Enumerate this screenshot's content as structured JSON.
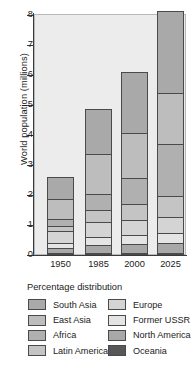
{
  "chart_data": {
    "type": "bar",
    "stacked": true,
    "title": "",
    "subtitle": "",
    "xlabel": "",
    "ylabel": "World population (millions)",
    "categories": [
      "1950",
      "1985",
      "2000",
      "2025"
    ],
    "ylim": [
      0,
      8
    ],
    "yticks": [
      0,
      1,
      2,
      3,
      4,
      5,
      6,
      7,
      8
    ],
    "ytick_labels": [
      "0",
      "1",
      "2",
      "3",
      "4",
      "5",
      "6",
      "7",
      "8"
    ],
    "grid": false,
    "legend_position": "below",
    "legend_title": "Percentage distribution",
    "stack_order_bottom_to_top": [
      "Oceania",
      "North America",
      "Former USSR",
      "Europe",
      "Latin America",
      "Africa",
      "East Asia",
      "South Asia"
    ],
    "series": [
      {
        "name": "Oceania",
        "color": "#575757",
        "values": [
          0.01,
          0.02,
          0.03,
          0.04
        ]
      },
      {
        "name": "North America",
        "color": "#a8a8a8",
        "values": [
          0.17,
          0.26,
          0.31,
          0.33
        ]
      },
      {
        "name": "Former USSR",
        "color": "#e4e4e4",
        "values": [
          0.18,
          0.28,
          0.29,
          0.35
        ]
      },
      {
        "name": "Europe",
        "color": "#d4d4d4",
        "values": [
          0.39,
          0.49,
          0.51,
          0.51
        ]
      },
      {
        "name": "Latin America",
        "color": "#c4c4c4",
        "values": [
          0.17,
          0.4,
          0.52,
          0.7
        ]
      },
      {
        "name": "Africa",
        "color": "#b0b0b0",
        "values": [
          0.22,
          0.55,
          0.87,
          1.76
        ]
      },
      {
        "name": "East Asia",
        "color": "#bdbdbd",
        "values": [
          0.68,
          1.33,
          1.49,
          1.68
        ]
      },
      {
        "name": "South Asia",
        "color": "#a9a9a9",
        "values": [
          0.73,
          1.49,
          2.05,
          2.74
        ]
      }
    ],
    "bar_totals": [
      2.55,
      4.82,
      6.07,
      8.11
    ]
  },
  "axis": {
    "y_title": "World population (millions)",
    "y_ticks": [
      "0",
      "1",
      "2",
      "3",
      "4",
      "5",
      "6",
      "7",
      "8"
    ],
    "x_ticks": [
      "1950",
      "1985",
      "2000",
      "2025"
    ]
  },
  "legend": {
    "title": "Percentage distribution",
    "rows": [
      {
        "left": {
          "label": "South Asia",
          "color": "#a9a9a9"
        },
        "right": {
          "label": "Europe",
          "color": "#d4d4d4"
        }
      },
      {
        "left": {
          "label": "East Asia",
          "color": "#bdbdbd"
        },
        "right": {
          "label": "Former USSR",
          "color": "#e4e4e4"
        }
      },
      {
        "left": {
          "label": "Africa",
          "color": "#b0b0b0"
        },
        "right": {
          "label": "North America",
          "color": "#a8a8a8"
        }
      },
      {
        "left": {
          "label": "Latin America",
          "color": "#c4c4c4"
        },
        "right": {
          "label": "Oceania",
          "color": "#575757"
        }
      }
    ]
  },
  "theme": {
    "plot_background": "#ececec",
    "page_background": "#ffffff",
    "axis_color": "#3a3a3a",
    "segment_border": "#4a4a4a",
    "text_color": "#1b1b1b"
  }
}
